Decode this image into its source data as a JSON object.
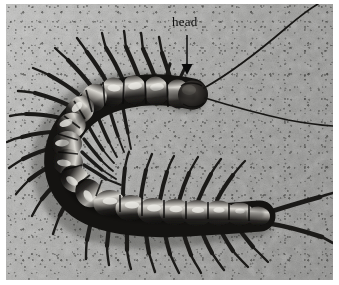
{
  "figure": {
    "scene": "centipede on concrete pavement, photographed from above",
    "border_color": "#ffffff",
    "photo": {
      "x": 6,
      "y": 4,
      "width": 327,
      "height": 276
    }
  },
  "annotations": [
    {
      "id": "head-label",
      "text": "head",
      "text_x": 172,
      "text_y": 18,
      "font_size": 13,
      "color": "#0b0b0b",
      "arrow": {
        "name": "head-arrow",
        "x1": 187,
        "y1": 35,
        "x2": 187,
        "y2": 74,
        "color": "#0b0b0b",
        "stroke_width": 1.4,
        "head": "filled-triangle",
        "direction": "down"
      }
    }
  ],
  "colors": {
    "background_concrete": "#a9a9a7",
    "concrete_light": "#c4c4c2",
    "concrete_dark": "#7d7d7b",
    "body_dark": "#1d1c1a",
    "body_mid": "#3a3836",
    "body_highlight": "#e8e7e2",
    "leg_color": "#211f1d",
    "annotation": "#0b0b0b",
    "frame": "#ffffff"
  },
  "anatomy": {
    "body_shape": "U-curve, head at upper right, tail at lower right",
    "segment_count": 21,
    "leg_pairs": 21,
    "antennae": 2,
    "terminal_legs": 2,
    "head_position": {
      "x": 186,
      "y": 90
    },
    "tail_position": {
      "x": 258,
      "y": 216
    }
  }
}
